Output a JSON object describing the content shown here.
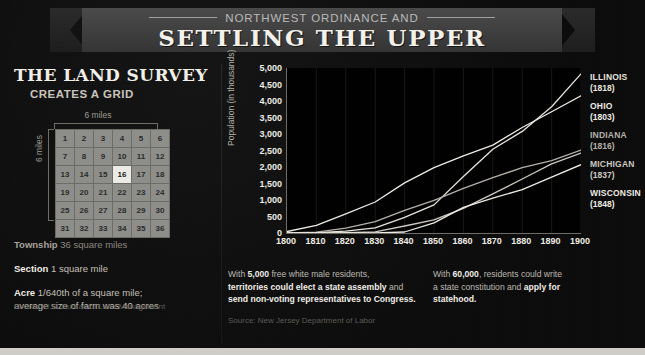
{
  "banner": {
    "kicker": "NORTHWEST ORDINANCE AND",
    "title": "SETTLING THE UPPER MIDWEST"
  },
  "left_panel": {
    "heading": "THE LAND SURVEY",
    "subheading": "CREATES A GRID",
    "grid": {
      "top_label": "6 miles",
      "side_label": "6 miles",
      "highlighted_cell": "16",
      "rows": [
        [
          "1",
          "2",
          "3",
          "4",
          "5",
          "6"
        ],
        [
          "7",
          "8",
          "9",
          "10",
          "11",
          "12"
        ],
        [
          "13",
          "14",
          "15",
          "16",
          "17",
          "18"
        ],
        [
          "19",
          "20",
          "21",
          "22",
          "23",
          "24"
        ],
        [
          "25",
          "26",
          "27",
          "28",
          "29",
          "30"
        ],
        [
          "31",
          "32",
          "33",
          "34",
          "35",
          "36"
        ]
      ]
    },
    "facts": [
      {
        "term": "Township",
        "definition": "36 square miles"
      },
      {
        "term": "Section",
        "definition": "1 square mile"
      },
      {
        "term": "Acre",
        "definition": "1/640th of a square mile;"
      },
      {
        "term": "",
        "definition": "average size of farm was 40 acres"
      }
    ],
    "source": "Source: U.S. Bureau of Land Management"
  },
  "notes": {
    "note1_pre": "With ",
    "note1_num": "5,000",
    "note1_mid": " free white male residents,",
    "note1_bold1": "territories could elect a state assembly",
    "note1_and": " and",
    "note1_bold2": "send non-voting representatives to Congress.",
    "note2_pre": "With ",
    "note2_num": "60,000",
    "note2_mid": ", residents could write",
    "note2_line2": "a state constitution and ",
    "note2_bold": "apply for",
    "note2_line3": "statehood.",
    "source": "Source: New Jersey Department of Labor"
  },
  "chart_data": {
    "type": "line",
    "title": "",
    "xlabel": "",
    "ylabel": "Population (in thousands)",
    "xlim": [
      1800,
      1900
    ],
    "ylim": [
      0,
      5000
    ],
    "grid": true,
    "legend_position": "right",
    "x": [
      1800,
      1810,
      1820,
      1830,
      1840,
      1850,
      1860,
      1870,
      1880,
      1890,
      1900
    ],
    "xticks": [
      "1800",
      "1810",
      "1820",
      "1830",
      "1840",
      "1850",
      "1860",
      "1870",
      "1880",
      "1890",
      "1900"
    ],
    "yticks": [
      "0",
      "500",
      "1,000",
      "1,500",
      "2,000",
      "2,500",
      "3,000",
      "3,500",
      "4,000",
      "4,500",
      "5,000"
    ],
    "series": [
      {
        "name": "ILLINOIS",
        "year": "(1818)",
        "color": "#e8e5de",
        "values": [
          0,
          12,
          55,
          157,
          476,
          851,
          1712,
          2540,
          3078,
          3826,
          4822
        ]
      },
      {
        "name": "OHIO",
        "year": "(1803)",
        "color": "#efece5",
        "values": [
          45,
          231,
          581,
          938,
          1519,
          1980,
          2340,
          2665,
          3198,
          3672,
          4158
        ]
      },
      {
        "name": "INDIANA",
        "year": "(1816)",
        "color": "#b5b1aa",
        "values": [
          5,
          25,
          147,
          343,
          686,
          988,
          1350,
          1680,
          1978,
          2192,
          2516
        ]
      },
      {
        "name": "MICHIGAN",
        "year": "(1837)",
        "color": "#cdc9c2",
        "values": [
          0,
          5,
          9,
          32,
          212,
          398,
          749,
          1184,
          1637,
          2094,
          2421
        ]
      },
      {
        "name": "WISCONSIN",
        "year": "(1848)",
        "color": "#efece5",
        "values": [
          0,
          0,
          0,
          0,
          31,
          305,
          776,
          1055,
          1315,
          1693,
          2069
        ]
      }
    ]
  }
}
